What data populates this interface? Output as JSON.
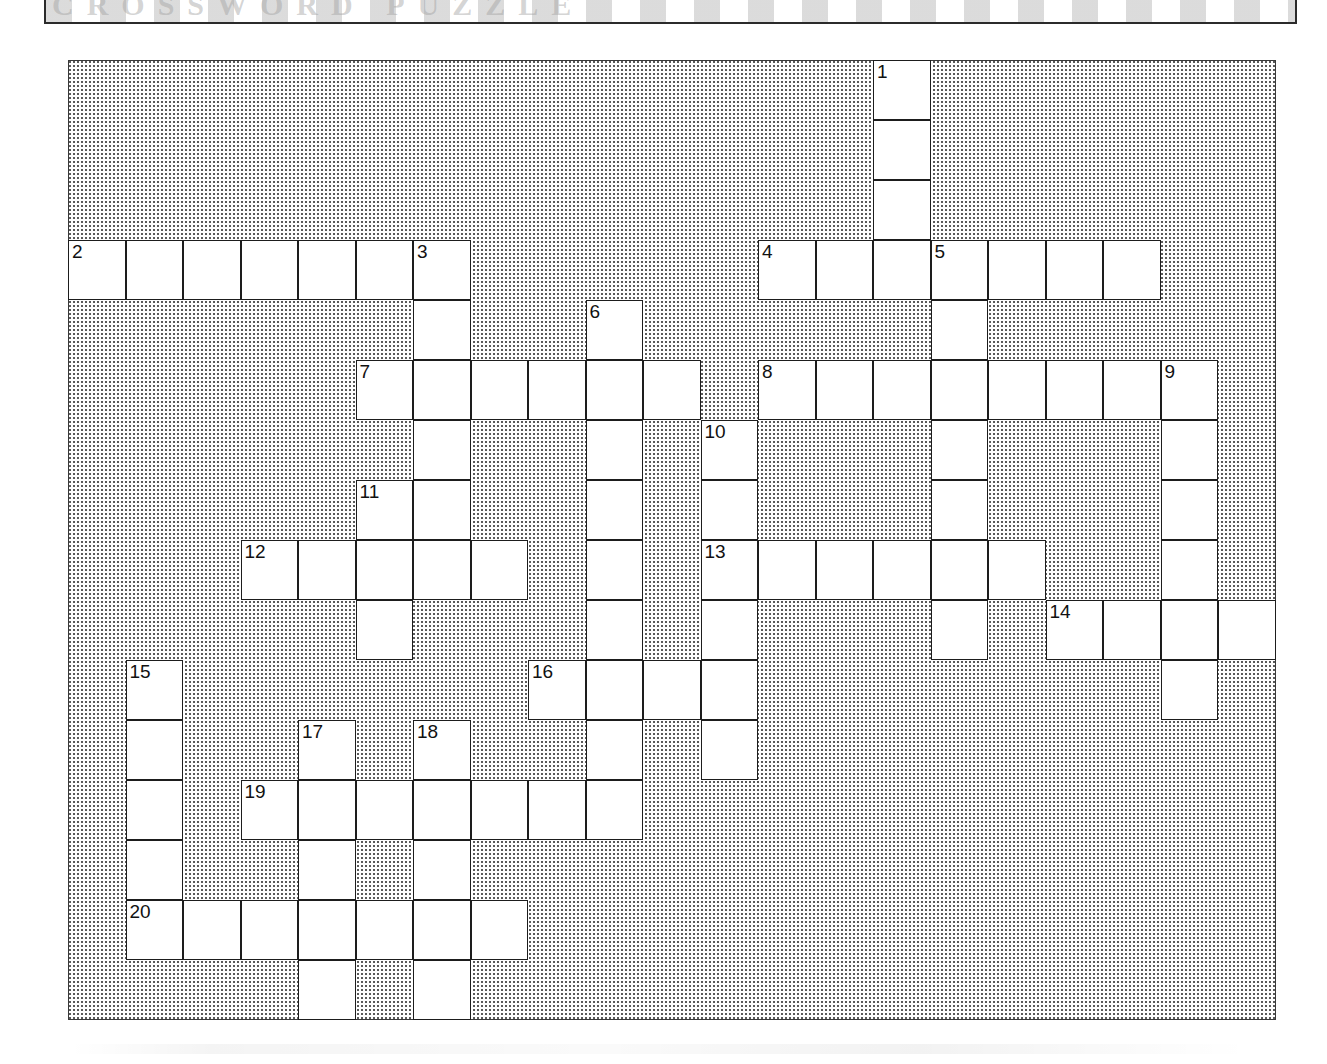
{
  "page": {
    "type": "crossword-puzzle-worksheet",
    "banner_ghost_text": "CROSSWORD PUZZLE"
  },
  "grid": {
    "columns": 21,
    "rows": 16,
    "cell_width": 57.5,
    "cell_height": 60,
    "origin_x": 68,
    "origin_y": 60,
    "blocked_fill": "#ffffff stipple",
    "cell_fill": "#ffffff",
    "border_color": "#1d1d1d"
  },
  "clue_numbers": [
    1,
    2,
    3,
    4,
    5,
    6,
    7,
    8,
    9,
    10,
    11,
    12,
    13,
    14,
    15,
    16,
    17,
    18,
    19,
    20
  ],
  "entries": [
    {
      "number": 1,
      "direction": "down",
      "col": 14,
      "row": 0,
      "length": 4
    },
    {
      "number": 2,
      "direction": "across",
      "col": 0,
      "row": 3,
      "length": 7
    },
    {
      "number": 3,
      "direction": "down",
      "col": 6,
      "row": 3,
      "length": 9
    },
    {
      "number": 4,
      "direction": "across",
      "col": 12,
      "row": 3,
      "length": 7
    },
    {
      "number": 5,
      "direction": "down",
      "col": 15,
      "row": 3,
      "length": 5
    },
    {
      "number": 6,
      "direction": "down",
      "col": 9,
      "row": 4,
      "length": 9
    },
    {
      "number": 7,
      "direction": "across",
      "col": 5,
      "row": 5,
      "length": 6
    },
    {
      "number": 8,
      "direction": "across",
      "col": 12,
      "row": 5,
      "length": 8
    },
    {
      "number": 9,
      "direction": "down",
      "col": 19,
      "row": 5,
      "length": 6
    },
    {
      "number": 10,
      "direction": "down",
      "col": 11,
      "row": 6,
      "length": 7
    },
    {
      "number": 11,
      "direction": "down",
      "col": 5,
      "row": 7,
      "length": 4
    },
    {
      "number": 12,
      "direction": "across",
      "col": 3,
      "row": 8,
      "length": 5
    },
    {
      "number": 13,
      "direction": "across",
      "col": 11,
      "row": 8,
      "length": 6
    },
    {
      "number": 14,
      "direction": "across",
      "col": 17,
      "row": 9,
      "length": 4
    },
    {
      "number": 15,
      "direction": "down",
      "col": 1,
      "row": 10,
      "length": 5
    },
    {
      "number": 16,
      "direction": "across",
      "col": 8,
      "row": 10,
      "length": 4
    },
    {
      "number": 17,
      "direction": "down",
      "col": 4,
      "row": 11,
      "length": 5
    },
    {
      "number": 18,
      "direction": "down",
      "col": 6,
      "row": 11,
      "length": 5
    },
    {
      "number": 19,
      "direction": "across",
      "col": 3,
      "row": 12,
      "length": 7
    },
    {
      "number": 20,
      "direction": "across",
      "col": 1,
      "row": 14,
      "length": 7
    }
  ],
  "cells": [
    {
      "col": 14,
      "row": 0,
      "num": "1"
    },
    {
      "col": 14,
      "row": 1
    },
    {
      "col": 14,
      "row": 2
    },
    {
      "col": 0,
      "row": 3,
      "num": "2"
    },
    {
      "col": 1,
      "row": 3
    },
    {
      "col": 2,
      "row": 3
    },
    {
      "col": 3,
      "row": 3
    },
    {
      "col": 4,
      "row": 3
    },
    {
      "col": 5,
      "row": 3
    },
    {
      "col": 6,
      "row": 3,
      "num": "3"
    },
    {
      "col": 12,
      "row": 3,
      "num": "4"
    },
    {
      "col": 13,
      "row": 3
    },
    {
      "col": 14,
      "row": 3
    },
    {
      "col": 15,
      "row": 3,
      "num": "5"
    },
    {
      "col": 16,
      "row": 3
    },
    {
      "col": 17,
      "row": 3
    },
    {
      "col": 18,
      "row": 3
    },
    {
      "col": 6,
      "row": 4
    },
    {
      "col": 9,
      "row": 4,
      "num": "6"
    },
    {
      "col": 15,
      "row": 4
    },
    {
      "col": 5,
      "row": 5,
      "num": "7"
    },
    {
      "col": 6,
      "row": 5
    },
    {
      "col": 7,
      "row": 5
    },
    {
      "col": 8,
      "row": 5
    },
    {
      "col": 9,
      "row": 5
    },
    {
      "col": 10,
      "row": 5
    },
    {
      "col": 12,
      "row": 5,
      "num": "8"
    },
    {
      "col": 13,
      "row": 5
    },
    {
      "col": 14,
      "row": 5
    },
    {
      "col": 15,
      "row": 5
    },
    {
      "col": 16,
      "row": 5
    },
    {
      "col": 17,
      "row": 5
    },
    {
      "col": 18,
      "row": 5
    },
    {
      "col": 19,
      "row": 5,
      "num": "9"
    },
    {
      "col": 6,
      "row": 6
    },
    {
      "col": 9,
      "row": 6
    },
    {
      "col": 11,
      "row": 6,
      "num": "10"
    },
    {
      "col": 15,
      "row": 6
    },
    {
      "col": 19,
      "row": 6
    },
    {
      "col": 5,
      "row": 7,
      "num": "11"
    },
    {
      "col": 6,
      "row": 7
    },
    {
      "col": 9,
      "row": 7
    },
    {
      "col": 11,
      "row": 7
    },
    {
      "col": 15,
      "row": 7
    },
    {
      "col": 19,
      "row": 7
    },
    {
      "col": 3,
      "row": 8,
      "num": "12"
    },
    {
      "col": 4,
      "row": 8
    },
    {
      "col": 5,
      "row": 8
    },
    {
      "col": 6,
      "row": 8
    },
    {
      "col": 7,
      "row": 8
    },
    {
      "col": 9,
      "row": 8
    },
    {
      "col": 11,
      "row": 8,
      "num": "13"
    },
    {
      "col": 12,
      "row": 8
    },
    {
      "col": 13,
      "row": 8
    },
    {
      "col": 14,
      "row": 8
    },
    {
      "col": 15,
      "row": 8
    },
    {
      "col": 16,
      "row": 8
    },
    {
      "col": 19,
      "row": 8
    },
    {
      "col": 5,
      "row": 9
    },
    {
      "col": 9,
      "row": 9
    },
    {
      "col": 11,
      "row": 9
    },
    {
      "col": 15,
      "row": 9
    },
    {
      "col": 17,
      "row": 9,
      "num": "14"
    },
    {
      "col": 18,
      "row": 9
    },
    {
      "col": 19,
      "row": 9
    },
    {
      "col": 20,
      "row": 9
    },
    {
      "col": 1,
      "row": 10,
      "num": "15"
    },
    {
      "col": 8,
      "row": 10,
      "num": "16"
    },
    {
      "col": 9,
      "row": 10
    },
    {
      "col": 10,
      "row": 10
    },
    {
      "col": 11,
      "row": 10
    },
    {
      "col": 19,
      "row": 10
    },
    {
      "col": 1,
      "row": 11
    },
    {
      "col": 4,
      "row": 11,
      "num": "17"
    },
    {
      "col": 6,
      "row": 11,
      "num": "18"
    },
    {
      "col": 9,
      "row": 11
    },
    {
      "col": 11,
      "row": 11
    },
    {
      "col": 1,
      "row": 12
    },
    {
      "col": 3,
      "row": 12,
      "num": "19"
    },
    {
      "col": 4,
      "row": 12
    },
    {
      "col": 5,
      "row": 12
    },
    {
      "col": 6,
      "row": 12
    },
    {
      "col": 7,
      "row": 12
    },
    {
      "col": 8,
      "row": 12
    },
    {
      "col": 9,
      "row": 12
    },
    {
      "col": 1,
      "row": 13
    },
    {
      "col": 4,
      "row": 13
    },
    {
      "col": 6,
      "row": 13
    },
    {
      "col": 1,
      "row": 14,
      "num": "20"
    },
    {
      "col": 2,
      "row": 14
    },
    {
      "col": 3,
      "row": 14
    },
    {
      "col": 4,
      "row": 14
    },
    {
      "col": 5,
      "row": 14
    },
    {
      "col": 6,
      "row": 14
    },
    {
      "col": 7,
      "row": 14
    },
    {
      "col": 4,
      "row": 15
    },
    {
      "col": 6,
      "row": 15
    }
  ]
}
